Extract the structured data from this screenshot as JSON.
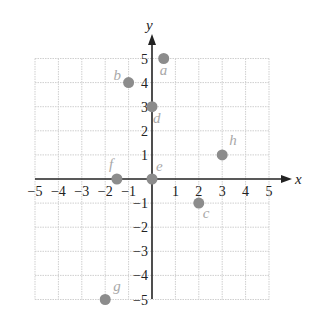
{
  "chart_data": {
    "type": "scatter",
    "title": "",
    "xlabel": "x",
    "ylabel": "y",
    "xlim": [
      -5,
      5
    ],
    "ylim": [
      -5,
      5
    ],
    "grid": true,
    "x_ticks": [
      "−5",
      "−4",
      "−3",
      "−2",
      "−1",
      "1",
      "2",
      "3",
      "4",
      "5"
    ],
    "y_ticks": [
      "5",
      "4",
      "3",
      "2",
      "1",
      "−1",
      "−2",
      "−3",
      "−4",
      "−5"
    ],
    "points": [
      {
        "label": "a",
        "x": 0.5,
        "y": 5
      },
      {
        "label": "b",
        "x": -1,
        "y": 4
      },
      {
        "label": "c",
        "x": 2,
        "y": -1
      },
      {
        "label": "d",
        "x": 0,
        "y": 3
      },
      {
        "label": "e",
        "x": 0,
        "y": 0
      },
      {
        "label": "f",
        "x": -1.5,
        "y": 0
      },
      {
        "label": "g",
        "x": -2,
        "y": -5
      },
      {
        "label": "h",
        "x": 3,
        "y": 1
      }
    ],
    "colors": {
      "point": "#8c8c8c",
      "point_label": "#a8a8a8",
      "axis": "#222222",
      "grid": "#cfcfcf"
    }
  }
}
